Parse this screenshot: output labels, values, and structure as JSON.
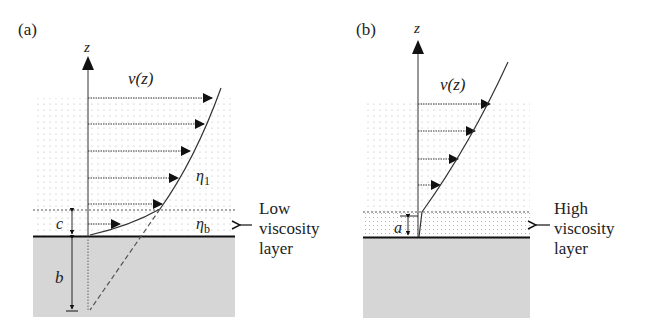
{
  "panels": [
    {
      "id": "a",
      "label": "(a)",
      "axis_label": "z",
      "velocity_label": "v(z)",
      "upper_viscosity": "η",
      "upper_viscosity_sub": "1",
      "layer_viscosity": "η",
      "layer_viscosity_sub": "b",
      "layer_thickness_label": "c",
      "slip_length_label": "b",
      "annotation_line1": "Low",
      "annotation_line2": "viscosity",
      "annotation_line3": "layer",
      "velocity_arrows": 6
    },
    {
      "id": "b",
      "label": "(b)",
      "axis_label": "z",
      "velocity_label": "v(z)",
      "layer_thickness_label": "a",
      "annotation_line1": "High",
      "annotation_line2": "viscosity",
      "annotation_line3": "layer",
      "velocity_arrows": 4
    }
  ],
  "colors": {
    "ink": "#222222",
    "fluid_dots": "#b8b8b8",
    "solid_fill": "#d6d6d6"
  }
}
